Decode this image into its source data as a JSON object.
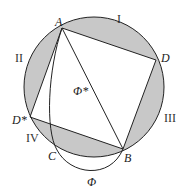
{
  "diagram": {
    "colors": {
      "shade": "#c8c8c8",
      "stroke": "#222222",
      "background": "#ffffff"
    },
    "circle": {
      "cx": 94,
      "cy": 87,
      "r": 70
    },
    "points": {
      "A": {
        "label": "A",
        "x": 62,
        "y": 28
      },
      "D": {
        "label": "D",
        "x": 156,
        "y": 60
      },
      "B": {
        "label": "B",
        "x": 123,
        "y": 149
      },
      "Dstar": {
        "label": "D*",
        "x": 30,
        "y": 117
      },
      "C": {
        "label": "C",
        "x": 57,
        "y": 150
      }
    },
    "regions": [
      "I",
      "II",
      "III",
      "IV"
    ],
    "curve_labels": {
      "phi": "Φ",
      "phi_star": "Φ*"
    }
  }
}
